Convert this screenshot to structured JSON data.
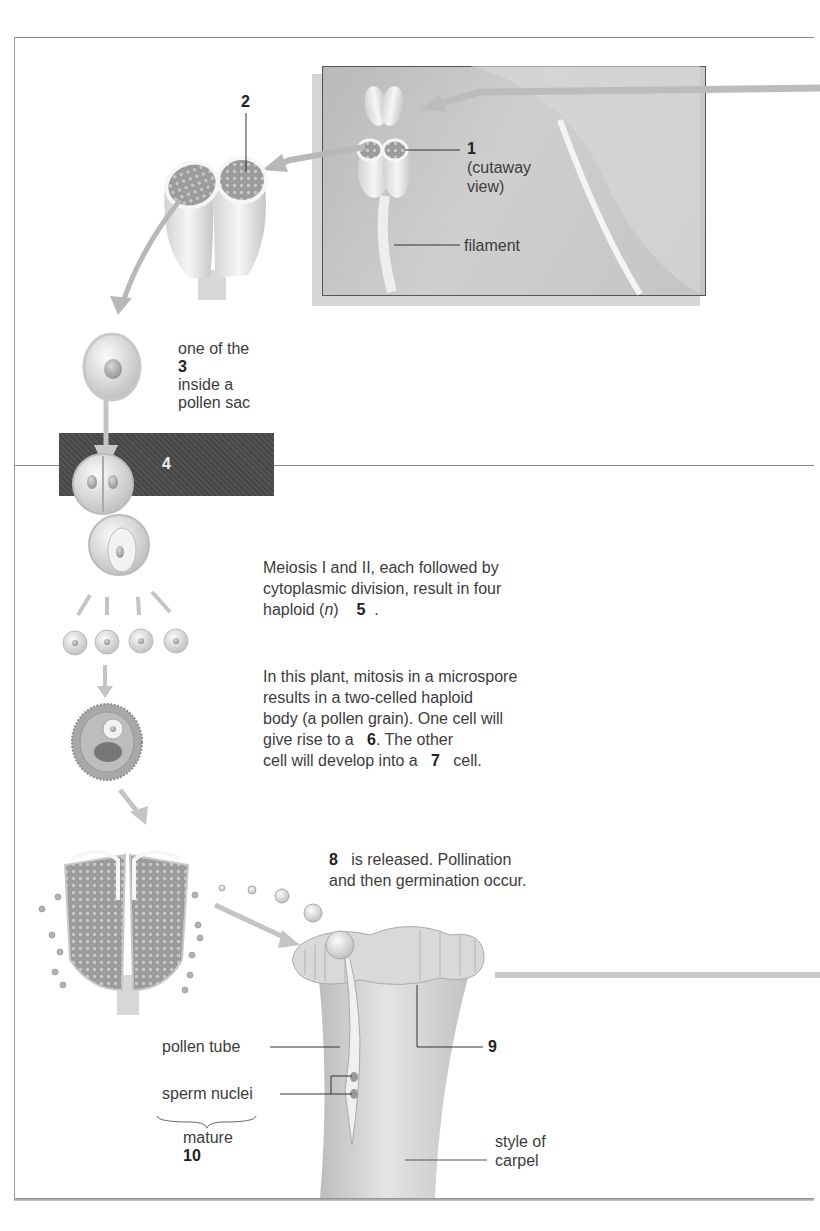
{
  "figure": {
    "stages": [
      {
        "id": "anther-inset",
        "label_number": "1",
        "label_note": "(cutaway view)"
      },
      {
        "id": "anther-cutaway",
        "label_number": "2"
      },
      {
        "id": "microspore-mother-cell",
        "label_prefix": "one of the",
        "label_number": "3",
        "label_suffix_line1": "inside a",
        "label_suffix_line2": "pollen sac"
      },
      {
        "id": "meiosis-band",
        "label_number": "4"
      },
      {
        "id": "microspores",
        "text_before": "Meiosis I and II, each followed by",
        "text_line2": "cytoplasmic division, result in four",
        "text_line3_prefix": "haploid (",
        "text_line3_italic": "n",
        "text_line3_mid": ")",
        "label_number": "5",
        "text_end": "."
      },
      {
        "id": "pollen-grain",
        "text_line1": "In this plant, mitosis in a microspore",
        "text_line2": "results in a two-celled haploid",
        "text_line3": "body (a pollen grain). One cell will",
        "text_line4_prefix": "give rise to a",
        "label_number_6": "6",
        "text_line4_end": ".  The other",
        "text_line5_prefix": "cell will develop into a",
        "label_number_7": "7",
        "text_line5_end": "cell."
      },
      {
        "id": "release",
        "label_number": "8",
        "text_line1": "is released. Pollination",
        "text_line2": "and then germination occur."
      },
      {
        "id": "stigma",
        "label_number": "9"
      },
      {
        "id": "mature-gametophyte",
        "label_prefix": "mature",
        "label_number": "10"
      }
    ],
    "part_labels": {
      "filament": "filament",
      "pollen_tube": "pollen tube",
      "sperm_nuclei": "sperm nuclei",
      "style_line1": "style of",
      "style_line2": "carpel"
    }
  }
}
